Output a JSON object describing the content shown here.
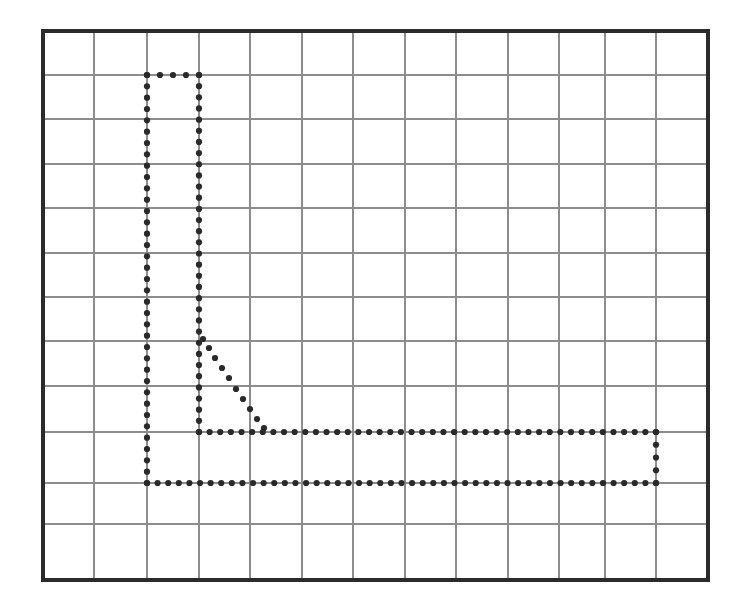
{
  "figure": {
    "title": "",
    "background_color": "#ffffff",
    "frame_color": "#2b2b2b",
    "grid_color": "#8d8d8d",
    "dot_color": "#2a2a2a",
    "frame": {
      "x0": 43,
      "y0": 31,
      "x1": 708,
      "y1": 580
    }
  },
  "chart_data": {
    "type": "scatter",
    "title": "",
    "xlabel": "",
    "ylabel": "",
    "grid": true,
    "legend": null,
    "axis_labels_visible": false,
    "tick_labels": {
      "x": [],
      "y": []
    },
    "xlim": [
      43,
      708
    ],
    "ylim": [
      31,
      580
    ],
    "grid_lines": {
      "vertical_x": [
        43,
        94,
        147,
        199,
        250,
        302,
        353,
        405,
        456,
        508,
        559,
        605,
        656,
        708
      ],
      "horizontal_y": [
        31,
        75,
        119,
        164,
        208,
        253,
        297,
        341,
        386,
        432,
        483,
        524,
        580
      ]
    },
    "series": [
      {
        "name": "dotted-step-curve",
        "marker": "dot",
        "marker_size": 3.1,
        "segments": [
          {
            "name": "top-horizontal-connector",
            "orientation": "horizontal",
            "y": 75,
            "x_start": 147,
            "x_end": 199,
            "dot_count": 5
          },
          {
            "name": "left-vertical-line",
            "orientation": "vertical",
            "x": 147,
            "y_start": 75,
            "y_end": 483,
            "dot_count": 37
          },
          {
            "name": "inner-vertical-line",
            "orientation": "vertical",
            "x": 199,
            "y_start": 75,
            "y_end": 432,
            "dot_count": 33
          },
          {
            "name": "diagonal-descent",
            "orientation": "diagonal",
            "points": [
              [
                203,
                339
              ],
              [
                209,
                348
              ],
              [
                215,
                358
              ],
              [
                222,
                368
              ],
              [
                229,
                378
              ],
              [
                236,
                389
              ],
              [
                243,
                399
              ],
              [
                250,
                409
              ],
              [
                257,
                419
              ],
              [
                264,
                428
              ]
            ]
          },
          {
            "name": "upper-horizontal-line",
            "orientation": "horizontal",
            "y": 432,
            "x_start": 199,
            "x_end": 656,
            "dot_count": 44
          },
          {
            "name": "lower-horizontal-line",
            "orientation": "horizontal",
            "y": 483,
            "x_start": 147,
            "x_end": 656,
            "dot_count": 49
          },
          {
            "name": "right-vertical-connector",
            "orientation": "vertical",
            "x": 656,
            "y_start": 432,
            "y_end": 483,
            "dot_count": 5
          }
        ]
      }
    ]
  }
}
